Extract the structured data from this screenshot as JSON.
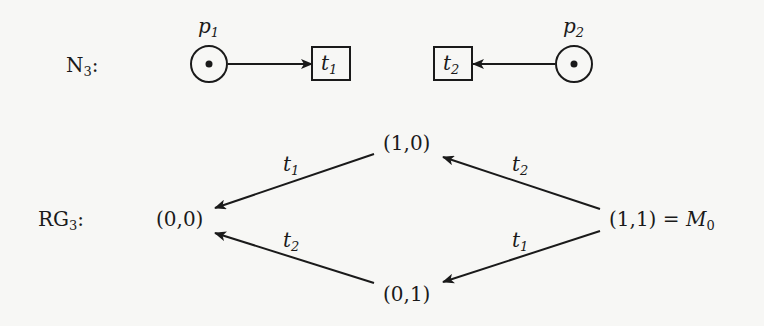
{
  "net": {
    "label": "N",
    "label_sub": "3",
    "label_suffix": ":",
    "places": [
      {
        "id": "p1",
        "name": "p",
        "sub": "1",
        "tokens": 1
      },
      {
        "id": "p2",
        "name": "p",
        "sub": "2",
        "tokens": 1
      }
    ],
    "transitions": [
      {
        "id": "t1",
        "name": "t",
        "sub": "1"
      },
      {
        "id": "t2",
        "name": "t",
        "sub": "2"
      }
    ],
    "arcs": [
      {
        "from": "p1",
        "to": "t1"
      },
      {
        "from": "p2",
        "to": "t2"
      }
    ]
  },
  "reachability_graph": {
    "label": "RG",
    "label_sub": "3",
    "label_suffix": ":",
    "nodes": [
      {
        "id": "m00",
        "text": "(0,0)"
      },
      {
        "id": "m10",
        "text": "(1,0)"
      },
      {
        "id": "m01",
        "text": "(0,1)"
      },
      {
        "id": "m11",
        "text": "(1,1)",
        "eq": " = ",
        "alias": "M",
        "alias_sub": "0"
      }
    ],
    "edges": [
      {
        "from": "m10",
        "to": "m00",
        "label": "t",
        "label_sub": "1"
      },
      {
        "from": "m01",
        "to": "m00",
        "label": "t",
        "label_sub": "2"
      },
      {
        "from": "m11",
        "to": "m10",
        "label": "t",
        "label_sub": "2"
      },
      {
        "from": "m11",
        "to": "m01",
        "label": "t",
        "label_sub": "1"
      }
    ]
  }
}
